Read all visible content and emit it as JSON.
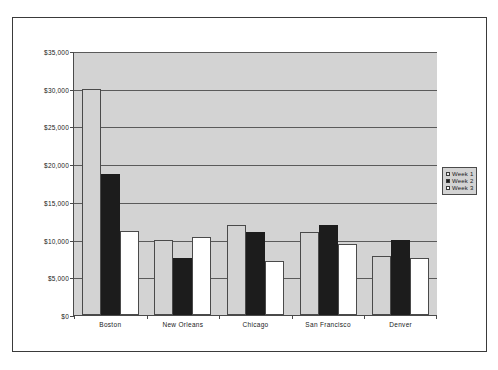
{
  "chart_data": {
    "type": "bar",
    "title": "",
    "subtitle": "",
    "xlabel": "",
    "ylabel": "",
    "categories": [
      "Boston",
      "New Orleans",
      "Chicago",
      "San Francisco",
      "Denver"
    ],
    "series": [
      {
        "name": "Week 1",
        "color": "#d3d3d3",
        "values": [
          30000,
          9900,
          12000,
          11000,
          7800
        ]
      },
      {
        "name": "Week 2",
        "color": "#1c1c1c",
        "values": [
          18700,
          7500,
          11000,
          12000,
          9900
        ]
      },
      {
        "name": "Week 3",
        "color": "#ffffff",
        "values": [
          11200,
          10300,
          7200,
          9400,
          7500
        ]
      }
    ],
    "ylim": [
      0,
      35000
    ],
    "ytick_step": 5000,
    "ytick_labels": [
      "$35,000",
      "$30,000",
      "$25,000",
      "$20,000",
      "$15,000",
      "$10,000",
      "$5,000",
      "$0"
    ],
    "ytick_values": [
      35000,
      30000,
      25000,
      20000,
      15000,
      10000,
      5000,
      0
    ],
    "grid": true,
    "legend_position": "right",
    "plot_background": "#d3d3d3",
    "gridline_color": "#5a5a5a",
    "axis_color": "#4a4a4a"
  },
  "legend": {
    "items": [
      {
        "label": "Week 1"
      },
      {
        "label": "Week 2"
      },
      {
        "label": "Week 3"
      }
    ]
  }
}
